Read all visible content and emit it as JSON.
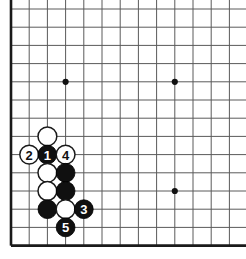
{
  "figure": {
    "kind": "go-board-diagram",
    "title": "",
    "board_region": "lower-left corner",
    "colors": {
      "background": "#ffffff",
      "grid": "#5a5a5a",
      "border": "#1a1a1a",
      "black_stone": "#101010",
      "white_stone": "#ffffff",
      "star_point": "#111111",
      "label_on_black": "#ffffff",
      "label_on_white": "#111111"
    }
  },
  "grid": {
    "origin_x": 11,
    "origin_y": 9,
    "spacing": 18.2,
    "cols": 13,
    "rows": 14,
    "left_border_col": 0,
    "bottom_border_row": 13,
    "stone_radius": 9.4,
    "star_points": [
      {
        "col": 3,
        "row": 4
      },
      {
        "col": 9,
        "row": 4
      },
      {
        "col": 9,
        "row": 10
      }
    ]
  },
  "stones": [
    {
      "id": "w-a",
      "color": "white",
      "col": 2,
      "row": 7,
      "label": ""
    },
    {
      "id": "w-2",
      "color": "white",
      "col": 1,
      "row": 8,
      "label": "2"
    },
    {
      "id": "b-1",
      "color": "black",
      "col": 2,
      "row": 8,
      "label": "1"
    },
    {
      "id": "w-4",
      "color": "white",
      "col": 3,
      "row": 8,
      "label": "4"
    },
    {
      "id": "w-b",
      "color": "white",
      "col": 2,
      "row": 9,
      "label": ""
    },
    {
      "id": "b-c",
      "color": "black",
      "col": 3,
      "row": 9,
      "label": ""
    },
    {
      "id": "w-d",
      "color": "white",
      "col": 2,
      "row": 10,
      "label": ""
    },
    {
      "id": "b-e",
      "color": "black",
      "col": 3,
      "row": 10,
      "label": ""
    },
    {
      "id": "b-f",
      "color": "black",
      "col": 2,
      "row": 11,
      "label": ""
    },
    {
      "id": "w-g",
      "color": "white",
      "col": 3,
      "row": 11,
      "label": ""
    },
    {
      "id": "b-3",
      "color": "black",
      "col": 4,
      "row": 11,
      "label": "3"
    },
    {
      "id": "b-5",
      "color": "black",
      "col": 3,
      "row": 12,
      "label": "5"
    }
  ],
  "move_sequence": [
    {
      "number": "1",
      "color": "black"
    },
    {
      "number": "2",
      "color": "white"
    },
    {
      "number": "3",
      "color": "black"
    },
    {
      "number": "4",
      "color": "white"
    },
    {
      "number": "5",
      "color": "black"
    }
  ]
}
